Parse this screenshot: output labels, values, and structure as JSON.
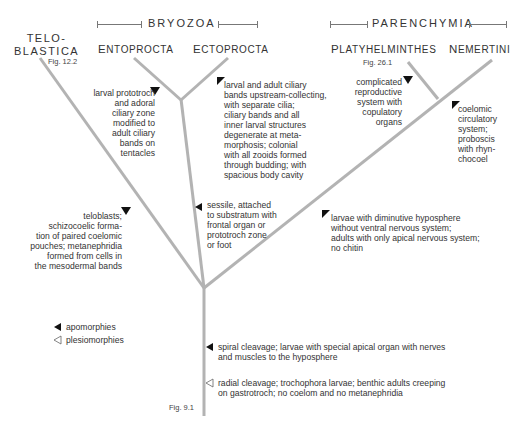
{
  "groups": {
    "bryozoa": "BRYOZOA",
    "parenchymia": "PARENCHYMIA"
  },
  "taxa": {
    "teloblastica_1": "TELO-",
    "teloblastica_2": "BLASTICA",
    "teloblastica_fig": "Fig. 12.2",
    "entoprocta_initial": "E",
    "entoprocta_rest": "NTOPROCTA",
    "ectoprocta_initial": "E",
    "ectoprocta_rest": "CTOPROCTA",
    "platyhelminthes_initial": "P",
    "platyhelminthes_rest": "LATYHELMINTHES",
    "platyhelminthes_fig": "Fig. 26.1",
    "nemertini_initial": "N",
    "nemertini_rest": "EMERTINI"
  },
  "characters": {
    "entoprocta": "larval prototroch\nand adoral\nciliary zone\nmodified to\nadult ciliary\nbands on\ntentacles",
    "ectoprocta": "larval and adult ciliary\nbands upstream-collecting,\nwith separate cilia;\nciliary bands and all\ninner larval structures\ndegenerate at meta-\nmorphosis; colonial\nwith all zooids formed\nthrough budding; with\nspacious body cavity",
    "platyhelminthes": "complicated\nreproductive\nsystem with\ncopulatory\norgans",
    "nemertini": "coelomic\ncirculatory\nsystem;\nproboscis\nwith rhyn-\nchocoel",
    "teloblastica": "teloblasts;\nschizocoelic forma-\ntion of paired coelomic\npouches; metanephridia\nformed from cells in\nthe mesodermal bands",
    "bryozoa": "sessile, attached\nto substratum with\nfrontal organ or\nprototroch zone\nor foot",
    "parenchymia": "larvae with diminutive hyposphere\nwithout ventral nervous system;\nadults with only apical nervous system;\nno chitin",
    "spiralia_apo": "spiral cleavage; larvae with special apical organ with nerves\nand muscles to the hyposphere",
    "spiralia_plesio": "radial cleavage; trochophora larvae; benthic adults creeping\non gastrotroch; no coelom and no metanephridia"
  },
  "root_fig": "Fig. 9.1",
  "legend": {
    "apomorphies": "apomorphies",
    "plesiomorphies": "plesiomorphies"
  },
  "colors": {
    "branch": "#b3b3b3",
    "marker": "#111111",
    "text": "#333333"
  }
}
